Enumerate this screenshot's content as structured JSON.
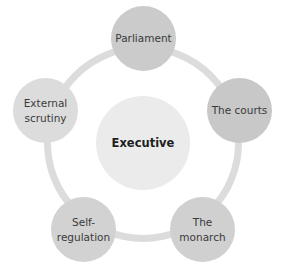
{
  "diagram": {
    "type": "cycle-hub",
    "center": {
      "label": "Executive",
      "color": "#ebebeb"
    },
    "ring_color": "#dcdcdc",
    "satellites": [
      {
        "label": "Parliament",
        "color": "#cbcbcb"
      },
      {
        "label": "The courts",
        "color": "#c8c8c8"
      },
      {
        "label": "The\nmonarch",
        "color": "#d0d0d0"
      },
      {
        "label": "Self-\nregulation",
        "color": "#d2d2d2"
      },
      {
        "label": "External\nscrutiny",
        "color": "#dcdcdc"
      }
    ]
  }
}
